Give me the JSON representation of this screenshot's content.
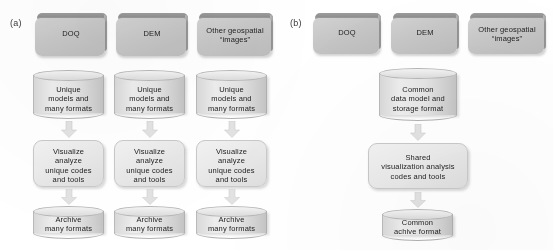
{
  "figure": {
    "type": "flow-diagram",
    "panels": [
      {
        "id": "a",
        "label": "(a)",
        "columns": [
          {
            "source": "DOQ",
            "store": "Unique\nmodels and\nmany formats",
            "process": "Visualize\nanalyze\nunique codes\nand tools",
            "archive": "Archive\nmany formats"
          },
          {
            "source": "DEM",
            "store": "Unique\nmodels and\nmany formats",
            "process": "Visualize\nanalyze\nunique codes\nand tools",
            "archive": "Archive\nmany formats"
          },
          {
            "source": "Other geospatial\n“images”",
            "store": "Unique\nmodels and\nmany formats",
            "process": "Visualize\nanalyze\nunique codes\nand tools",
            "archive": "Archive\nmany formats"
          }
        ]
      },
      {
        "id": "b",
        "label": "(b)",
        "sources": [
          "DOQ",
          "DEM",
          "Other geospatial\n“images”"
        ],
        "store": "Common\ndata model and\nstorage format",
        "process": "Shared\nvisualization analysis\ncodes and tools",
        "archive": "Common\nachive format"
      }
    ],
    "colors": {
      "source_box_face": "#c7c7c7",
      "source_box_lip": "#939393",
      "cylinder_face": "#e6e6e6",
      "process_box_face": "#ececec",
      "arrow_fill": "#e0e0e0",
      "text": "#1d1d1d",
      "background": "#ffffff"
    }
  }
}
